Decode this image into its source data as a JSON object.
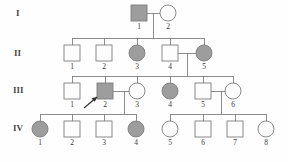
{
  "figure": {
    "kind": "pedigree-chart",
    "width": 288,
    "height": 162,
    "background_color": "#fefefe",
    "line_color": "#808080",
    "symbol_stroke_color": "#7d7d7d",
    "affected_fill_color": "#9d9d9d",
    "unaffected_fill_color": "#fdfdfd",
    "proband_marker_color": "#2e2e2e"
  },
  "generation_labels": [
    {
      "id": "gen-I",
      "text": "I",
      "x": 16,
      "y": 16
    },
    {
      "id": "gen-II",
      "text": "II",
      "x": 14,
      "y": 56
    },
    {
      "id": "gen-III",
      "text": "III",
      "x": 13,
      "y": 93
    },
    {
      "id": "gen-IV",
      "text": "IV",
      "x": 13,
      "y": 131
    }
  ],
  "individuals": [
    {
      "id": "I-1",
      "generation": "I",
      "number": "1",
      "sex": "male",
      "affected": true,
      "cx": 139,
      "cy": 13,
      "label_x": 139,
      "label_y": 29,
      "proband": false
    },
    {
      "id": "I-2",
      "generation": "I",
      "number": "2",
      "sex": "female",
      "affected": false,
      "cx": 168,
      "cy": 13,
      "label_x": 168,
      "label_y": 29,
      "proband": false
    },
    {
      "id": "II-1",
      "generation": "II",
      "number": "1",
      "sex": "male",
      "affected": false,
      "cx": 72,
      "cy": 53,
      "label_x": 72,
      "label_y": 69,
      "proband": false
    },
    {
      "id": "II-2",
      "generation": "II",
      "number": "2",
      "sex": "male",
      "affected": false,
      "cx": 104,
      "cy": 53,
      "label_x": 104,
      "label_y": 69,
      "proband": false
    },
    {
      "id": "II-3",
      "generation": "II",
      "number": "3",
      "sex": "female",
      "affected": true,
      "cx": 137,
      "cy": 53,
      "label_x": 137,
      "label_y": 69,
      "proband": false
    },
    {
      "id": "II-4",
      "generation": "II",
      "number": "4",
      "sex": "male",
      "affected": false,
      "cx": 170,
      "cy": 53,
      "label_x": 170,
      "label_y": 69,
      "proband": false
    },
    {
      "id": "II-5",
      "generation": "II",
      "number": "5",
      "sex": "female",
      "affected": true,
      "cx": 204,
      "cy": 53,
      "label_x": 204,
      "label_y": 69,
      "proband": false
    },
    {
      "id": "III-1",
      "generation": "III",
      "number": "1",
      "sex": "male",
      "affected": false,
      "cx": 72,
      "cy": 91,
      "label_x": 72,
      "label_y": 107,
      "proband": false
    },
    {
      "id": "III-2",
      "generation": "III",
      "number": "2",
      "sex": "male",
      "affected": true,
      "cx": 105,
      "cy": 91,
      "label_x": 105,
      "label_y": 107,
      "proband": true
    },
    {
      "id": "III-3",
      "generation": "III",
      "number": "3",
      "sex": "female",
      "affected": false,
      "cx": 137,
      "cy": 91,
      "label_x": 137,
      "label_y": 107,
      "proband": false
    },
    {
      "id": "III-4",
      "generation": "III",
      "number": "4",
      "sex": "female",
      "affected": true,
      "cx": 170,
      "cy": 91,
      "label_x": 170,
      "label_y": 107,
      "proband": false
    },
    {
      "id": "III-5",
      "generation": "III",
      "number": "5",
      "sex": "male",
      "affected": false,
      "cx": 203,
      "cy": 91,
      "label_x": 203,
      "label_y": 107,
      "proband": false
    },
    {
      "id": "III-6",
      "generation": "III",
      "number": "6",
      "sex": "female",
      "affected": false,
      "cx": 233,
      "cy": 91,
      "label_x": 233,
      "label_y": 107,
      "proband": false
    },
    {
      "id": "IV-1",
      "generation": "IV",
      "number": "1",
      "sex": "female",
      "affected": true,
      "cx": 40,
      "cy": 129,
      "label_x": 40,
      "label_y": 145,
      "proband": false
    },
    {
      "id": "IV-2",
      "generation": "IV",
      "number": "2",
      "sex": "male",
      "affected": false,
      "cx": 72,
      "cy": 129,
      "label_x": 72,
      "label_y": 145,
      "proband": false
    },
    {
      "id": "IV-3",
      "generation": "IV",
      "number": "3",
      "sex": "male",
      "affected": false,
      "cx": 104,
      "cy": 129,
      "label_x": 104,
      "label_y": 145,
      "proband": false
    },
    {
      "id": "IV-4",
      "generation": "IV",
      "number": "4",
      "sex": "female",
      "affected": true,
      "cx": 136,
      "cy": 129,
      "label_x": 136,
      "label_y": 145,
      "proband": false
    },
    {
      "id": "IV-5",
      "generation": "IV",
      "number": "5",
      "sex": "female",
      "affected": false,
      "cx": 170,
      "cy": 129,
      "label_x": 170,
      "label_y": 145,
      "proband": false
    },
    {
      "id": "IV-6",
      "generation": "IV",
      "number": "6",
      "sex": "male",
      "affected": false,
      "cx": 203,
      "cy": 129,
      "label_x": 203,
      "label_y": 145,
      "proband": false
    },
    {
      "id": "IV-7",
      "generation": "IV",
      "number": "7",
      "sex": "male",
      "affected": false,
      "cx": 235,
      "cy": 129,
      "label_x": 235,
      "label_y": 145,
      "proband": false
    },
    {
      "id": "IV-8",
      "generation": "IV",
      "number": "8",
      "sex": "female",
      "affected": false,
      "cx": 266,
      "cy": 129,
      "label_x": 266,
      "label_y": 145,
      "proband": false
    }
  ],
  "symbol_geometry": {
    "square_size": 16,
    "circle_radius": 8
  },
  "connections": [
    {
      "id": "mate-I-1-I-2",
      "kind": "mating-line",
      "d": "M 147 13 L 160 13"
    },
    {
      "id": "desc-I",
      "kind": "descent-line",
      "d": "M 153.5 13 L 153.5 38"
    },
    {
      "id": "sib-II",
      "kind": "sibship-line",
      "d": "M 72 38 L 204 38"
    },
    {
      "id": "drop-II-1",
      "kind": "drop-line",
      "d": "M 72 38 L 72 45"
    },
    {
      "id": "drop-II-2",
      "kind": "drop-line",
      "d": "M 104 38 L 104 45"
    },
    {
      "id": "drop-II-3",
      "kind": "drop-line",
      "d": "M 137 38 L 137 45"
    },
    {
      "id": "drop-II-4",
      "kind": "drop-line",
      "d": "M 170 38 L 170 45"
    },
    {
      "id": "drop-II-5",
      "kind": "drop-line",
      "d": "M 204 38 L 204 45"
    },
    {
      "id": "mate-II-4-II-5",
      "kind": "mating-line",
      "d": "M 178 53 L 196 53"
    },
    {
      "id": "desc-II",
      "kind": "descent-line",
      "d": "M 187 53 L 187 76"
    },
    {
      "id": "sib-III",
      "kind": "sibship-line",
      "d": "M 72 76 L 233 76"
    },
    {
      "id": "drop-III-1",
      "kind": "drop-line",
      "d": "M 72 76 L 72 83"
    },
    {
      "id": "drop-III-2",
      "kind": "drop-line",
      "d": "M 105 76 L 105 83"
    },
    {
      "id": "drop-III-3",
      "kind": "drop-line",
      "d": "M 137 76 L 137 83"
    },
    {
      "id": "drop-III-4",
      "kind": "drop-line",
      "d": "M 170 76 L 170 83"
    },
    {
      "id": "drop-III-5",
      "kind": "drop-line",
      "d": "M 203 76 L 203 83"
    },
    {
      "id": "drop-III-6",
      "kind": "drop-line",
      "d": "M 233 76 L 233 83"
    },
    {
      "id": "mate-III-2-III-3",
      "kind": "mating-line",
      "d": "M 113 91 L 129 91"
    },
    {
      "id": "desc-III-left",
      "kind": "descent-line",
      "d": "M 124 91 L 124 114"
    },
    {
      "id": "sib-IV-left",
      "kind": "sibship-line",
      "d": "M 40 114 L 136 114"
    },
    {
      "id": "drop-IV-1",
      "kind": "drop-line",
      "d": "M 40 114 L 40 121"
    },
    {
      "id": "drop-IV-2",
      "kind": "drop-line",
      "d": "M 72 114 L 72 121"
    },
    {
      "id": "drop-IV-3",
      "kind": "drop-line",
      "d": "M 104 114 L 104 121"
    },
    {
      "id": "drop-IV-4",
      "kind": "drop-line",
      "d": "M 136 114 L 136 121"
    },
    {
      "id": "mate-III-5-III-6",
      "kind": "mating-line",
      "d": "M 211 91 L 225 91"
    },
    {
      "id": "desc-III-right",
      "kind": "descent-line",
      "d": "M 221 91 L 221 114"
    },
    {
      "id": "sib-IV-right",
      "kind": "sibship-line",
      "d": "M 170 114 L 266 114"
    },
    {
      "id": "drop-IV-5",
      "kind": "drop-line",
      "d": "M 170 114 L 170 121"
    },
    {
      "id": "drop-IV-6",
      "kind": "drop-line",
      "d": "M 203 114 L 203 121"
    },
    {
      "id": "drop-IV-7",
      "kind": "drop-line",
      "d": "M 235 114 L 235 121"
    },
    {
      "id": "drop-IV-8",
      "kind": "drop-line",
      "d": "M 266 114 L 266 121"
    }
  ],
  "proband_arrow": {
    "target": "III-2",
    "shaft": "M 84 108 L 97 97",
    "head": "M 97 97 L 91.5 98.3 L 94.8 101.8 Z"
  }
}
